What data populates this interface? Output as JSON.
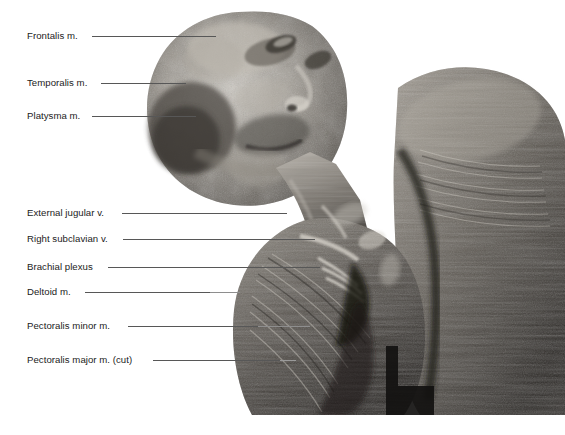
{
  "plate": {
    "caption_fragment": "regional",
    "background_color": "#ffffff",
    "label_color": "#1b1b1b",
    "leader_color": "#575757"
  },
  "figure": {
    "name": "cadaver-dissection-head-neck-shoulder",
    "tone": "grayscale"
  },
  "labels": [
    {
      "id": "frontalis",
      "text": "Frontalis m.",
      "x": 27,
      "y": 30,
      "leader_x": 92,
      "leader_y": 36,
      "leader_w": 124
    },
    {
      "id": "temporalis",
      "text": "Temporalis m.",
      "x": 27,
      "y": 77,
      "leader_x": 101,
      "leader_y": 83,
      "leader_w": 85
    },
    {
      "id": "platysma",
      "text": "Platysma m.",
      "x": 27,
      "y": 110,
      "leader_x": 92,
      "leader_y": 116,
      "leader_w": 104
    },
    {
      "id": "external-jugular-vein",
      "text": "External jugular v.",
      "x": 27,
      "y": 207,
      "leader_x": 122,
      "leader_y": 213,
      "leader_w": 165
    },
    {
      "id": "right-subclavian-vein",
      "text": "Right subclavian v.",
      "x": 27,
      "y": 233,
      "leader_x": 123,
      "leader_y": 239,
      "leader_w": 192
    },
    {
      "id": "brachial-plexus",
      "text": "Brachial plexus",
      "x": 27,
      "y": 261,
      "leader_x": 108,
      "leader_y": 267,
      "leader_w": 212
    },
    {
      "id": "deltoid",
      "text": "Deltoid m.",
      "x": 27,
      "y": 286,
      "leader_x": 85,
      "leader_y": 292,
      "leader_w": 125
    },
    {
      "id": "pectoralis-minor",
      "text": "Pectoralis minor m.",
      "x": 27,
      "y": 320,
      "leader_x": 128,
      "leader_y": 326,
      "leader_w": 130
    },
    {
      "id": "pectoralis-major-cut",
      "text": "Pectoralis major m. (cut)",
      "x": 27,
      "y": 354,
      "leader_x": 153,
      "leader_y": 360,
      "leader_w": 127
    }
  ]
}
